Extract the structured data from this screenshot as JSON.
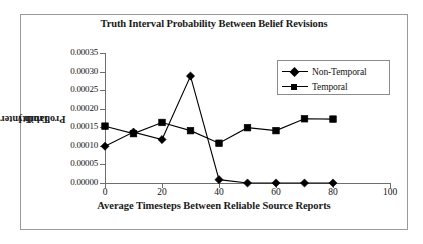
{
  "chart_data": {
    "type": "line",
    "title": "Truth Interval Probability Between Belief Revisions",
    "xlabel": "Average Timesteps Between Reliable Source Reports",
    "ylabel": "Truth Interval Probability",
    "ylabel_line1": "Truth Interval",
    "ylabel_line2": "Probability",
    "x": [
      0,
      10,
      20,
      30,
      40,
      50,
      60,
      70,
      80
    ],
    "xlim": [
      0,
      100
    ],
    "ylim": [
      0.0,
      0.00035
    ],
    "grid": false,
    "legend_position": "top-right",
    "xticks": [
      "0",
      "20",
      "40",
      "60",
      "80",
      "100"
    ],
    "xtick_values": [
      0,
      20,
      40,
      60,
      80,
      100
    ],
    "yticks": [
      "0.00000",
      "0.00005",
      "0.00010",
      "0.00015",
      "0.00020",
      "0.00025",
      "0.00030",
      "0.00035"
    ],
    "ytick_values": [
      0.0,
      5e-05,
      0.0001,
      0.00015,
      0.0002,
      0.00025,
      0.0003,
      0.00035
    ],
    "series": [
      {
        "name": "Non-Temporal",
        "marker": "diamond",
        "color": "#000000",
        "values": [
          9.9e-05,
          0.000137,
          0.000117,
          0.000288,
          9e-06,
          0.0,
          0.0,
          0.0,
          0.0
        ]
      },
      {
        "name": "Temporal",
        "marker": "square",
        "color": "#000000",
        "values": [
          0.000153,
          0.000133,
          0.000163,
          0.000141,
          0.000107,
          0.000149,
          0.000141,
          0.000173,
          0.000172
        ]
      }
    ]
  },
  "legend": {
    "items": [
      {
        "label": "Non-Temporal",
        "marker": "diamond"
      },
      {
        "label": "Temporal",
        "marker": "square"
      }
    ]
  },
  "colors": {
    "axis": "#6e6e6e",
    "frame": "#9a9a9a",
    "series": "#000000",
    "text": "#141414",
    "background": "#ffffff"
  }
}
